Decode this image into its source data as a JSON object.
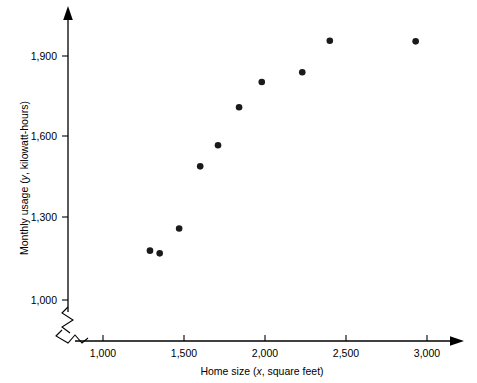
{
  "figure": {
    "background_color": "#ffffff",
    "point_color": "#1a1a1a",
    "axis_color": "#000000"
  },
  "chart_data": {
    "type": "scatter",
    "title": "",
    "xlabel": "Home size (x, square feet)",
    "xlabel_parts": {
      "before": "Home size (",
      "italic": "x",
      "after": ", square feet)"
    },
    "ylabel": "Monthly usage (y, kilowatt-hours)",
    "ylabel_parts": {
      "before": "Monthly usage (",
      "italic": "y",
      "after": ", kilowatt-hours)"
    },
    "xlim": [
      900,
      3100
    ],
    "ylim": [
      950,
      2000
    ],
    "xticks": [
      1000,
      1500,
      2000,
      2500,
      3000
    ],
    "xtick_labels": [
      "1,000",
      "1,500",
      "2,000",
      "2,500",
      "3,000"
    ],
    "yticks": [
      1000,
      1300,
      1600,
      1900
    ],
    "ytick_labels": [
      "1,000",
      "1,300",
      "1,600",
      "1,900"
    ],
    "axis_break_x": true,
    "axis_break_y": true,
    "grid": false,
    "legend": false,
    "x": [
      1290,
      1350,
      1470,
      1600,
      1710,
      1840,
      1980,
      2230,
      2400,
      2930
    ],
    "y": [
      1182,
      1172,
      1264,
      1493,
      1571,
      1711,
      1804,
      1840,
      1956,
      1954
    ],
    "points": [
      {
        "x": 1290,
        "y": 1182
      },
      {
        "x": 1350,
        "y": 1172
      },
      {
        "x": 1470,
        "y": 1264
      },
      {
        "x": 1600,
        "y": 1493
      },
      {
        "x": 1710,
        "y": 1571
      },
      {
        "x": 1840,
        "y": 1711
      },
      {
        "x": 1980,
        "y": 1804
      },
      {
        "x": 2230,
        "y": 1840
      },
      {
        "x": 2400,
        "y": 1956
      },
      {
        "x": 2930,
        "y": 1954
      }
    ]
  }
}
